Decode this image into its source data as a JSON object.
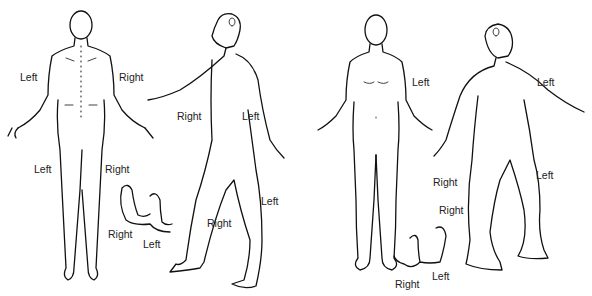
{
  "diagram": {
    "type": "body-chart",
    "views": [
      {
        "id": "posterior",
        "name": "Back view"
      },
      {
        "id": "right-lateral",
        "name": "Right side view"
      },
      {
        "id": "anterior",
        "name": "Front view"
      },
      {
        "id": "left-lateral",
        "name": "Left side view"
      }
    ],
    "labels": [
      {
        "text": "Left",
        "x": 20,
        "y": 72,
        "view": "posterior"
      },
      {
        "text": "Right",
        "x": 119,
        "y": 72,
        "view": "posterior"
      },
      {
        "text": "Left",
        "x": 34,
        "y": 164,
        "view": "posterior"
      },
      {
        "text": "Right",
        "x": 105,
        "y": 164,
        "view": "posterior"
      },
      {
        "text": "Right",
        "x": 177,
        "y": 111,
        "view": "right-lateral"
      },
      {
        "text": "Left",
        "x": 242,
        "y": 111,
        "view": "right-lateral"
      },
      {
        "text": "Left",
        "x": 261,
        "y": 196,
        "view": "right-lateral"
      },
      {
        "text": "Right",
        "x": 207,
        "y": 218,
        "view": "right-lateral"
      },
      {
        "text": "Right",
        "x": 108,
        "y": 229,
        "view": "feet-right"
      },
      {
        "text": "Left",
        "x": 143,
        "y": 239,
        "view": "feet-right"
      },
      {
        "text": "Left",
        "x": 412,
        "y": 77,
        "view": "anterior"
      },
      {
        "text": "Left",
        "x": 537,
        "y": 77,
        "view": "left-lateral"
      },
      {
        "text": "Right",
        "x": 433,
        "y": 177,
        "view": "left-lateral"
      },
      {
        "text": "Left",
        "x": 536,
        "y": 170,
        "view": "left-lateral"
      },
      {
        "text": "Right",
        "x": 439,
        "y": 205,
        "view": "left-lateral"
      },
      {
        "text": "Left",
        "x": 432,
        "y": 271,
        "view": "feet-left"
      },
      {
        "text": "Right",
        "x": 395,
        "y": 279,
        "view": "feet-left"
      }
    ]
  }
}
